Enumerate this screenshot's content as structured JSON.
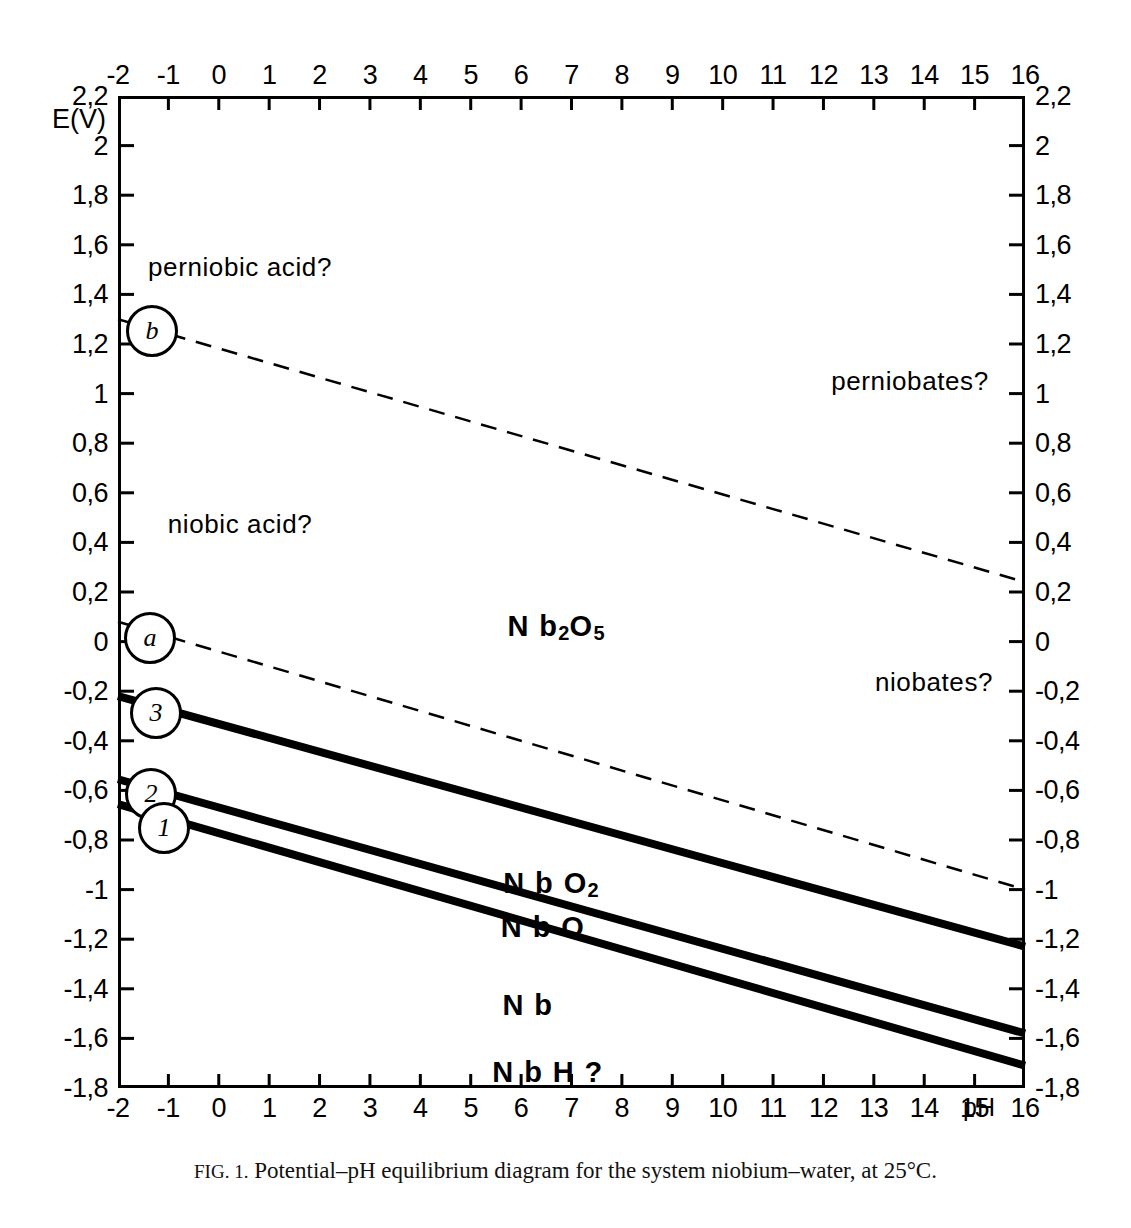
{
  "figure": {
    "caption_prefix": "FIG. 1.",
    "caption_text": "Potential–pH equilibrium diagram for the system niobium–water, at 25°C.",
    "axis_titles": {
      "y": "E(V)",
      "x": "pH"
    }
  },
  "axes": {
    "x_ticks": [
      "-2",
      "-1",
      "0",
      "1",
      "2",
      "3",
      "4",
      "5",
      "6",
      "7",
      "8",
      "9",
      "10",
      "11",
      "12",
      "13",
      "14",
      "15",
      "16"
    ],
    "y_ticks": [
      "2,2",
      "2",
      "1,8",
      "1,6",
      "1,4",
      "1,2",
      "1",
      "0,8",
      "0,6",
      "0,4",
      "0,2",
      "0",
      "-0,2",
      "-0,4",
      "-0,6",
      "-0,8",
      "-1",
      "-1,2",
      "-1,4",
      "-1,6",
      "-1,8"
    ]
  },
  "markers": [
    {
      "id": "b",
      "label": "b"
    },
    {
      "id": "a",
      "label": "a"
    },
    {
      "id": "3",
      "label": "3"
    },
    {
      "id": "2",
      "label": "2"
    },
    {
      "id": "1",
      "label": "1"
    }
  ],
  "regions": [
    {
      "id": "perniobic-acid",
      "label": "perniobic acid?"
    },
    {
      "id": "niobic-acid",
      "label": "niobic acid?"
    },
    {
      "id": "perniobates",
      "label": "perniobates?"
    },
    {
      "id": "niobates",
      "label": "niobates?"
    },
    {
      "id": "nb2o5",
      "label": "Nb₂O₅",
      "base": "N b",
      "sub1": "2",
      "mid": "O",
      "sub2": "5"
    },
    {
      "id": "nbo2",
      "label": "NbO₂",
      "base": "N b O",
      "sub1": "2"
    },
    {
      "id": "nbo",
      "label": "N b O"
    },
    {
      "id": "nb",
      "label": "N b"
    },
    {
      "id": "nbh",
      "label": "N b H ?"
    }
  ],
  "chart_data": {
    "type": "line",
    "title": "Potential–pH equilibrium diagram for the system niobium–water, at 25°C",
    "xlabel": "pH",
    "ylabel": "E(V)",
    "xlim": [
      -2,
      16
    ],
    "ylim": [
      -1.8,
      2.2
    ],
    "xticks": [
      -2,
      -1,
      0,
      1,
      2,
      3,
      4,
      5,
      6,
      7,
      8,
      9,
      10,
      11,
      12,
      13,
      14,
      15,
      16
    ],
    "yticks": [
      2.2,
      2,
      1.8,
      1.6,
      1.4,
      1.2,
      1,
      0.8,
      0.6,
      0.4,
      0.2,
      0,
      -0.2,
      -0.4,
      -0.6,
      -0.8,
      -1,
      -1.2,
      -1.4,
      -1.6,
      -1.8
    ],
    "grid": false,
    "legend": "none",
    "series": [
      {
        "name": "b",
        "style": "dashed",
        "label_marker": "b",
        "x": [
          -2,
          16
        ],
        "y": [
          1.3,
          0.24
        ],
        "description": "oxygen evolution line (water stability upper limit)"
      },
      {
        "name": "a",
        "style": "dashed",
        "label_marker": "a",
        "x": [
          -2,
          16
        ],
        "y": [
          0.08,
          -1.0
        ],
        "description": "hydrogen evolution line (water stability lower limit)"
      },
      {
        "name": "3",
        "style": "solid-thick",
        "label_marker": "3",
        "x": [
          -2,
          16
        ],
        "y": [
          -0.22,
          -1.23
        ],
        "description": "Nb2O5 / NbO2 equilibrium"
      },
      {
        "name": "2",
        "style": "solid-thick",
        "label_marker": "2",
        "x": [
          -2,
          16
        ],
        "y": [
          -0.555,
          -1.58
        ],
        "description": "NbO2 / NbO equilibrium"
      },
      {
        "name": "1",
        "style": "solid-thick",
        "label_marker": "1",
        "x": [
          -2,
          16
        ],
        "y": [
          -0.655,
          -1.71
        ],
        "description": "NbO / Nb equilibrium"
      }
    ],
    "annotations": [
      {
        "text": "perniobic acid?",
        "x": -0.6,
        "y": 1.49
      },
      {
        "text": "niobic acid?",
        "x": 0.4,
        "y": 0.47
      },
      {
        "text": "perniobates?",
        "x": 13.7,
        "y": 1.07
      },
      {
        "text": "niobates?",
        "x": 14.2,
        "y": -0.14
      },
      {
        "text": "Nb2O5",
        "x": 6.7,
        "y": 0.07
      },
      {
        "text": "NbO2",
        "x": 6.5,
        "y": -0.97
      },
      {
        "text": "NbO",
        "x": 6.4,
        "y": -1.15
      },
      {
        "text": "Nb",
        "x": 6.0,
        "y": -1.47
      },
      {
        "text": "NbH?",
        "x": 6.4,
        "y": -1.74
      }
    ]
  }
}
